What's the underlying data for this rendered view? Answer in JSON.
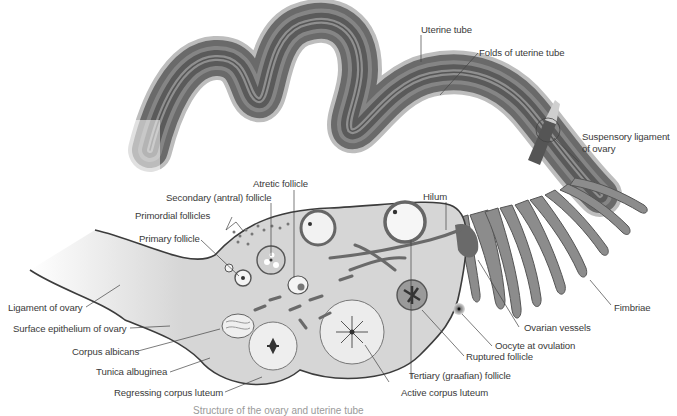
{
  "figure": {
    "caption_partial": "Structure of the ovary and uterine tube"
  },
  "labels": {
    "uterine_tube": "Uterine tube",
    "folds_of_uterine_tube": "Folds of uterine tube",
    "suspensory_ligament_1": "Suspensory ligament",
    "suspensory_ligament_2": "of ovary",
    "hilum": "Hilum",
    "atretic_follicle": "Atretic follicle",
    "secondary_follicle": "Secondary (antral) follicle",
    "primordial_follicles": "Primordial follicles",
    "primary_follicle": "Primary follicle",
    "ligament_of_ovary": "Ligament of ovary",
    "surface_epithelium": "Surface epithelium of ovary",
    "corpus_albicans": "Corpus albicans",
    "tunica_albuginea": "Tunica albuginea",
    "regressing_corpus_luteum": "Regressing corpus luteum",
    "active_corpus_luteum": "Active corpus luteum",
    "tertiary_follicle": "Tertiary (graafian) follicle",
    "ruptured_follicle": "Ruptured follicle",
    "oocyte_at_ovulation": "Oocyte at ovulation",
    "ovarian_vessels": "Ovarian vessels",
    "fimbriae": "Fimbriae"
  },
  "colors": {
    "tube_dark": "#5e5e5e",
    "tube_light": "#b8b8b8",
    "ovary_fill": "#d6d6d6",
    "outline": "#3c3c3c",
    "leader": "#444444",
    "text": "#3a3a3a"
  }
}
